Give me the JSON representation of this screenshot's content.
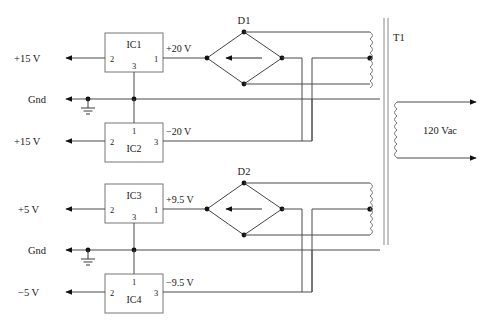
{
  "diagram": {
    "colors": {
      "wire": "#4a4a4a",
      "text": "#1a1a1a",
      "box": "#777777",
      "node": "#111111",
      "background": "#ffffff"
    }
  },
  "rails": {
    "top_positive": "+15 V",
    "top_ground": "Gnd",
    "top_negative": "+15 V",
    "bottom_positive": "+5 V",
    "bottom_ground": "Gnd",
    "bottom_negative": "−5 V"
  },
  "regulators": [
    {
      "id": "ic1",
      "name": "IC1",
      "pin_left": "2",
      "pin_right": "1",
      "pin_bottom": "3",
      "output_label": "+15 V",
      "input_label": "+20 V"
    },
    {
      "id": "ic2",
      "name": "IC2",
      "pin_left": "2",
      "pin_right": "3",
      "pin_top": "1",
      "output_label": "+15 V",
      "input_label": "−20 V"
    },
    {
      "id": "ic3",
      "name": "IC3",
      "pin_left": "2",
      "pin_right": "1",
      "pin_bottom": "3",
      "output_label": "+5 V",
      "input_label": "+9.5 V"
    },
    {
      "id": "ic4",
      "name": "IC4",
      "pin_left": "2",
      "pin_right": "3",
      "pin_top": "1",
      "output_label": "−5 V",
      "input_label": "−9.5 V"
    }
  ],
  "rectifiers": [
    {
      "id": "d1",
      "name": "D1"
    },
    {
      "id": "d2",
      "name": "D2"
    }
  ],
  "transformer": {
    "name": "T1",
    "secondary_label": "120 Vac"
  },
  "nodes": {
    "supply_voltages": [
      "+20 V",
      "−20 V",
      "+9.5 V",
      "−9.5 V"
    ],
    "ground_symbol": "earth-ground"
  }
}
